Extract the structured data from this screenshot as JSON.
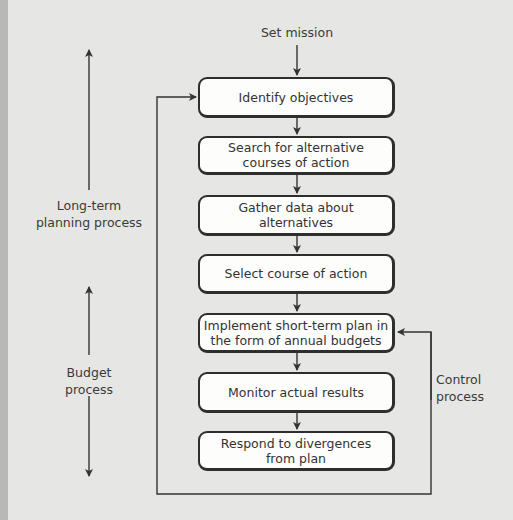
{
  "diagram": {
    "start": "Set mission",
    "steps": [
      {
        "label": "Identify objectives"
      },
      {
        "label": "Search for alternative\ncourses of action"
      },
      {
        "label": "Gather data about alternatives"
      },
      {
        "label": "Select course of action"
      },
      {
        "label": "Implement short-term plan in\nthe form of annual budgets"
      },
      {
        "label": "Monitor actual results"
      },
      {
        "label": "Respond to divergences\nfrom plan"
      }
    ],
    "side_labels": {
      "long_term": "Long-term\nplanning process",
      "budget": "Budget\nprocess",
      "control": "Control\nprocess"
    },
    "colors": {
      "background": "#e6e6e4",
      "box_fill": "#fdfdfc",
      "stroke": "#2e2e2e"
    }
  }
}
